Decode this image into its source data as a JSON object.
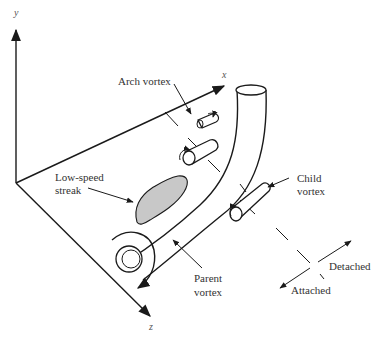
{
  "figure": {
    "axes": {
      "x_label": "x",
      "y_label": "y",
      "z_label": "z"
    },
    "labels": {
      "arch_vortex": "Arch vortex",
      "low_speed_streak_line1": "Low-speed",
      "low_speed_streak_line2": "streak",
      "child_vortex_line1": "Child",
      "child_vortex_line2": "vortex",
      "parent_vortex_line1": "Parent",
      "parent_vortex_line2": "vortex",
      "detached": "Detached",
      "attached": "Attached"
    },
    "colors": {
      "line": "#1a1a1a",
      "streak_fill": "#c8c8c8",
      "background": "#ffffff"
    }
  }
}
